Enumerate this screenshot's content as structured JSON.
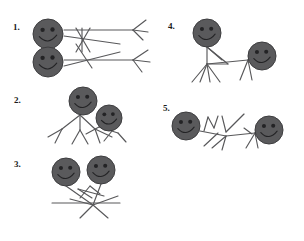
{
  "page": {
    "background_color": "#ffffff",
    "width": 304,
    "height": 241
  },
  "style": {
    "head_fill": "#5a5a5c",
    "head_stroke": "#3d3d3f",
    "limb_stroke": "#58585a",
    "face_feature_color": "#232325",
    "number_color": "#1a1a1a"
  },
  "items": [
    {
      "number": "1.",
      "number_x": 13,
      "number_y": 23,
      "figure_count": 2,
      "description": "two stick figures lying horizontally head-to-head on the left with crossed limbs in the middle and splayed legs on the right",
      "heads": [
        {
          "cx": 48,
          "cy": 34,
          "r": 15
        },
        {
          "cx": 48,
          "cy": 62,
          "r": 15
        }
      ],
      "limbs": [
        [
          64,
          30,
          133,
          30
        ],
        [
          64,
          36,
          120,
          44
        ],
        [
          64,
          60,
          133,
          60
        ],
        [
          64,
          66,
          120,
          52
        ],
        [
          76,
          28,
          90,
          52
        ],
        [
          90,
          28,
          76,
          52
        ],
        [
          82,
          28,
          82,
          52
        ],
        [
          76,
          44,
          92,
          68
        ],
        [
          133,
          30,
          146,
          20
        ],
        [
          133,
          30,
          148,
          32
        ],
        [
          133,
          30,
          143,
          40
        ],
        [
          133,
          60,
          148,
          50
        ],
        [
          133,
          60,
          150,
          62
        ],
        [
          133,
          60,
          142,
          72
        ]
      ]
    },
    {
      "number": "2.",
      "number_x": 14,
      "number_y": 96,
      "figure_count": 2,
      "description": "two stick figures leaning together forming a tent shape with spread legs",
      "heads": [
        {
          "cx": 83,
          "cy": 101,
          "r": 14
        },
        {
          "cx": 109,
          "cy": 118,
          "r": 13
        }
      ],
      "limbs": [
        [
          80,
          115,
          62,
          129
        ],
        [
          62,
          129,
          55,
          143
        ],
        [
          62,
          129,
          48,
          137
        ],
        [
          80,
          115,
          95,
          129
        ],
        [
          95,
          129,
          100,
          143
        ],
        [
          95,
          129,
          112,
          137
        ],
        [
          80,
          115,
          80,
          130
        ],
        [
          80,
          130,
          72,
          144
        ],
        [
          80,
          130,
          88,
          144
        ],
        [
          99,
          127,
          86,
          134
        ],
        [
          99,
          127,
          118,
          133
        ],
        [
          118,
          133,
          126,
          142
        ],
        [
          112,
          131,
          104,
          141
        ]
      ]
    },
    {
      "number": "3.",
      "number_x": 14,
      "number_y": 160,
      "figure_count": 2,
      "description": "two stick figures side by side with heads up, arms crossed in the middle and legs splayed downward over a horizontal line",
      "heads": [
        {
          "cx": 66,
          "cy": 172,
          "r": 14
        },
        {
          "cx": 101,
          "cy": 170,
          "r": 14
        }
      ],
      "limbs": [
        [
          66,
          186,
          93,
          205
        ],
        [
          101,
          184,
          93,
          205
        ],
        [
          78,
          189,
          104,
          196
        ],
        [
          78,
          189,
          92,
          198
        ],
        [
          90,
          186,
          80,
          198
        ],
        [
          90,
          186,
          100,
          194
        ],
        [
          52,
          203,
          120,
          203
        ],
        [
          93,
          205,
          80,
          218
        ],
        [
          93,
          205,
          108,
          218
        ],
        [
          93,
          205,
          118,
          196
        ],
        [
          93,
          205,
          70,
          199
        ]
      ]
    },
    {
      "number": "4.",
      "number_x": 168,
      "number_y": 22,
      "figure_count": 2,
      "description": "one upright stick figure on the left with many splayed legs connected to a seated figure on the right",
      "heads": [
        {
          "cx": 207,
          "cy": 33,
          "r": 14
        },
        {
          "cx": 262,
          "cy": 56,
          "r": 14
        }
      ],
      "limbs": [
        [
          207,
          47,
          207,
          64
        ],
        [
          207,
          47,
          222,
          60
        ],
        [
          207,
          47,
          228,
          64
        ],
        [
          207,
          64,
          248,
          60
        ],
        [
          248,
          60,
          262,
          54
        ],
        [
          207,
          64,
          192,
          82
        ],
        [
          207,
          64,
          200,
          82
        ],
        [
          207,
          64,
          210,
          82
        ],
        [
          207,
          64,
          220,
          82
        ],
        [
          248,
          60,
          240,
          80
        ],
        [
          248,
          60,
          252,
          80
        ],
        [
          228,
          64,
          207,
          64
        ]
      ]
    },
    {
      "number": "5.",
      "number_x": 163,
      "number_y": 104,
      "figure_count": 2,
      "description": "two stick figures lying low facing each other joined by a long horizontal body line with legs and arms radiating from a central joint",
      "heads": [
        {
          "cx": 186,
          "cy": 126,
          "r": 14
        },
        {
          "cx": 269,
          "cy": 130,
          "r": 14
        }
      ],
      "limbs": [
        [
          200,
          131,
          226,
          136
        ],
        [
          226,
          136,
          255,
          133
        ],
        [
          255,
          133,
          256,
          132
        ],
        [
          204,
          131,
          208,
          117
        ],
        [
          208,
          117,
          214,
          128
        ],
        [
          214,
          128,
          218,
          116
        ],
        [
          222,
          116,
          226,
          132
        ],
        [
          226,
          132,
          244,
          114
        ],
        [
          226,
          136,
          212,
          148
        ],
        [
          226,
          136,
          222,
          150
        ],
        [
          218,
          133,
          204,
          146
        ],
        [
          255,
          133,
          246,
          148
        ],
        [
          255,
          133,
          258,
          148
        ],
        [
          252,
          134,
          244,
          128
        ]
      ]
    }
  ]
}
